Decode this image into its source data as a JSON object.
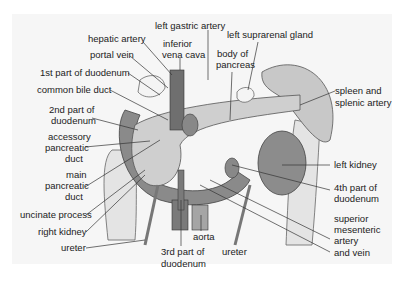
{
  "diagram": {
    "labels": {
      "left_gastric_artery": "left gastric artery",
      "hepatic_artery": "hepatic artery",
      "inferior_vena_cava_1": "inferior",
      "inferior_vena_cava_2": "vena cava",
      "left_suprarenal_gland": "left suprarenal gland",
      "portal_vein": "portal vein",
      "body_of_pancreas_1": "body of",
      "body_of_pancreas_2": "pancreas",
      "first_part_duodenum": "1st part of duodenum",
      "common_bile_duct": "common bile duct",
      "spleen_1": "spleen and",
      "spleen_2": "splenic artery",
      "second_part_1": "2nd part of",
      "second_part_2": "duodenum",
      "accessory_1": "accessory",
      "accessory_2": "pancreatic",
      "accessory_3": "duct",
      "main_duct_1": "main",
      "main_duct_2": "pancreatic",
      "main_duct_3": "duct",
      "left_kidney": "left kidney",
      "fourth_part_1": "4th part of",
      "fourth_part_2": "duodenum",
      "uncinate_process": "uncinate process",
      "right_kidney": "right kidney",
      "ureter_left": "ureter",
      "aorta": "aorta",
      "sma_1": "superior",
      "sma_2": "mesenteric",
      "sma_3": "artery",
      "sma_4": "and vein",
      "third_part_1": "3rd part of",
      "third_part_2": "duodenum",
      "ureter_right": "ureter"
    },
    "colors": {
      "background": "#f6f6f6",
      "duodenum_dark": "#8a8a8a",
      "colon": "#e4e4e4",
      "pancreas": "#cfcfcf",
      "kidney": "#8c8c8c",
      "spleen": "#c8c8c8",
      "vessel": "#7a7a7a",
      "gland": "#f4f4f4"
    }
  }
}
